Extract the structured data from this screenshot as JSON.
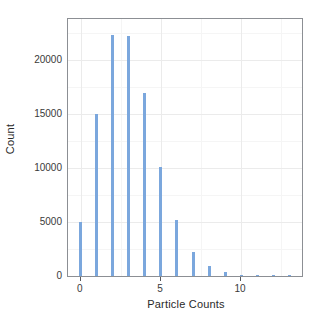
{
  "chart_data": {
    "type": "bar",
    "title": "",
    "subtitle": "",
    "xlabel": "Particle Counts",
    "ylabel": "Count",
    "categories": [
      0,
      1,
      2,
      3,
      4,
      5,
      6,
      7,
      8,
      9,
      10,
      11,
      12,
      13
    ],
    "values": [
      5000,
      15000,
      22300,
      22200,
      16900,
      10100,
      5200,
      2200,
      900,
      350,
      120,
      80,
      60,
      50
    ],
    "series": [
      {
        "name": "Particle count frequency",
        "values": [
          5000,
          15000,
          22300,
          22200,
          16900,
          10100,
          5200,
          2200,
          900,
          350,
          120,
          80,
          60,
          50
        ]
      }
    ],
    "xlim": [
      -0.8,
      13.8
    ],
    "ylim": [
      0,
      23750
    ],
    "xticks": [
      0,
      5,
      10
    ],
    "xtick_labels": [
      "0",
      "5",
      "10"
    ],
    "yticks": [
      0,
      5000,
      10000,
      15000,
      20000
    ],
    "ytick_labels": [
      "0",
      "5000",
      "10000",
      "15000",
      "20000"
    ],
    "y_minor_ticks": [
      2500,
      7500,
      12500,
      17500,
      22500
    ],
    "x_minor_ticks": [
      2.5,
      7.5,
      12.5
    ],
    "grid": true,
    "legend": false,
    "legend_position": "none",
    "bar_color": "#7ba7dd",
    "panel_background": "#ffffff",
    "panel_border_color": "#8c8f94",
    "grid_major_color": "#ebebeb",
    "grid_minor_color": "#f5f5f5",
    "bar_relative_width": 0.18
  }
}
